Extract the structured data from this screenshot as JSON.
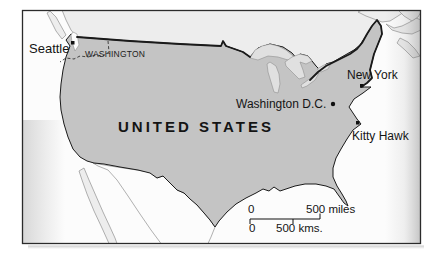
{
  "figure": {
    "type": "map",
    "region_label": "UNITED STATES",
    "state_label": "WASHINGTON",
    "cities": [
      {
        "name": "Seattle",
        "marker": "square"
      },
      {
        "name": "New York",
        "marker": "square"
      },
      {
        "name": "Washington D.C.",
        "marker": "dot"
      },
      {
        "name": "Kitty Hawk",
        "marker": "square"
      }
    ],
    "scale_bar": {
      "miles_zero": "0",
      "miles_label": "500 miles",
      "kms_zero": "0",
      "kms_label": "500 kms."
    },
    "colors": {
      "us_fill": "#c4c4c4",
      "neighbor_fill": "#ededed",
      "lake_fill": "#e0e0e0",
      "water": "#fcfcfc",
      "border": "#1a1a1a",
      "coast": "#8f8f8f",
      "text": "#141414",
      "frame": "#2b2b2b"
    }
  }
}
